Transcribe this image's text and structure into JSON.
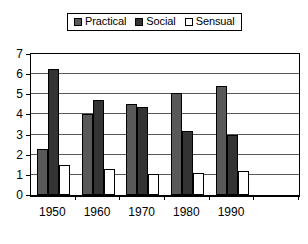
{
  "legend": {
    "position": "top-center",
    "entries": [
      {
        "label": "Practical",
        "color": "#595959",
        "swatch": "legend-swatch-practical"
      },
      {
        "label": "Social",
        "color": "#333333",
        "swatch": "legend-swatch-social"
      },
      {
        "label": "Sensual",
        "color": "#ffffff",
        "swatch": "legend-swatch-sensual"
      }
    ]
  },
  "axes": {
    "y_ticks": [
      "0",
      "1",
      "2",
      "3",
      "4",
      "5",
      "6",
      "7"
    ],
    "x_ticks": [
      "1950",
      "1960",
      "1970",
      "1980",
      "1990",
      ""
    ]
  },
  "chart_data": {
    "type": "bar",
    "title": "",
    "subtitle": "",
    "xlabel": "",
    "ylabel": "",
    "ylim": [
      0,
      7
    ],
    "ytick_step": 1,
    "grid": true,
    "grid_axis": "y",
    "legend_position": "top-center",
    "categories": [
      "1950",
      "1960",
      "1970",
      "1980",
      "1990",
      ""
    ],
    "series": [
      {
        "name": "Practical",
        "color": "#595959",
        "values": [
          2.3,
          4.0,
          4.5,
          5.05,
          5.4,
          null
        ]
      },
      {
        "name": "Social",
        "color": "#333333",
        "values": [
          6.25,
          4.7,
          4.35,
          3.2,
          3.0,
          null
        ]
      },
      {
        "name": "Sensual",
        "color": "#ffffff",
        "values": [
          1.5,
          1.3,
          1.05,
          1.1,
          1.2,
          null
        ]
      }
    ]
  }
}
